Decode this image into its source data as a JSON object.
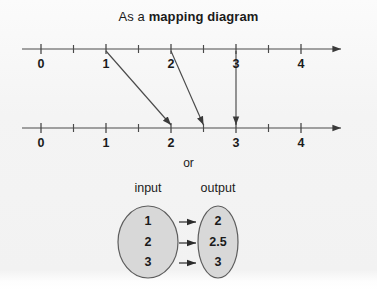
{
  "title": {
    "prefix": "As a ",
    "emphasis": "mapping diagram"
  },
  "connector_label": "or",
  "number_lines": {
    "tick_labels": [
      "0",
      "1",
      "2",
      "3",
      "4"
    ],
    "minor_ticks": [
      0.5,
      1.5,
      2.5,
      3.5
    ],
    "unit_px": 65,
    "origin_x": 41,
    "top_line_y": 49,
    "bottom_line_y": 128,
    "axis_start_x": 22,
    "axis_end_x": 341,
    "top": {
      "name": "input-number-line",
      "labels": [
        "0",
        "1",
        "2",
        "3",
        "4"
      ]
    },
    "bottom": {
      "name": "output-number-line",
      "labels": [
        "0",
        "1",
        "2",
        "3",
        "4"
      ]
    }
  },
  "mappings": [
    {
      "from": 1,
      "to": 2
    },
    {
      "from": 2,
      "to": 2.5
    },
    {
      "from": 3,
      "to": 3
    }
  ],
  "set_diagram": {
    "input_label": "input",
    "output_label": "output",
    "input_values": [
      "1",
      "2",
      "3"
    ],
    "output_values": [
      "2",
      "2.5",
      "3"
    ],
    "input_oval": {
      "cx": 148,
      "cy": 242,
      "rx": 30,
      "ry": 36
    },
    "output_oval": {
      "cx": 218,
      "cy": 242,
      "rx": 20,
      "ry": 36
    }
  },
  "colors": {
    "ink": "#1b1b1b",
    "line": "#4a4a4a",
    "oval_fill": "#d8d8d8",
    "oval_stroke": "#5d5d5d",
    "background": "#f4f4f4"
  }
}
